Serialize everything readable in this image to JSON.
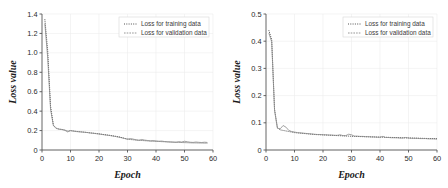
{
  "figure": {
    "panel_count": 2,
    "background": "#ffffff"
  },
  "chart_data": [
    {
      "id": "left-panel",
      "type": "line",
      "title": "",
      "xlabel": "Epoch",
      "ylabel": "Loss value",
      "xlim": [
        0,
        60
      ],
      "ylim": [
        0,
        1.4
      ],
      "xticks": [
        0,
        10,
        20,
        30,
        40,
        50,
        60
      ],
      "xtick_labels": [
        "0",
        "10",
        "20",
        "30",
        "40",
        "50",
        "60"
      ],
      "yticks": [
        0,
        0.2,
        0.4,
        0.6,
        0.8,
        1.0,
        1.2,
        1.4
      ],
      "ytick_labels": [
        "0",
        "0.2",
        "0.4",
        "0.6",
        "0.8",
        "1.0",
        "1.2",
        "1.4"
      ],
      "grid": true,
      "legend_position": "upper-right",
      "legend": [
        "Loss for training data",
        "Loss for validation data"
      ],
      "series": [
        {
          "name": "Loss for training data",
          "style": "dotted",
          "color": "#3c3c3c",
          "x": [
            1,
            2,
            3,
            4,
            5,
            6,
            7,
            8,
            9,
            10,
            11,
            12,
            13,
            14,
            15,
            16,
            17,
            18,
            19,
            20,
            21,
            22,
            23,
            24,
            25,
            26,
            27,
            28,
            29,
            30,
            31,
            32,
            33,
            34,
            35,
            36,
            37,
            38,
            39,
            40,
            41,
            42,
            43,
            44,
            45,
            46,
            47,
            48,
            49,
            50,
            51,
            52,
            53,
            54,
            55,
            56,
            57,
            58
          ],
          "values": [
            1.345,
            1.02,
            0.45,
            0.255,
            0.225,
            0.215,
            0.212,
            0.205,
            0.195,
            0.2,
            0.196,
            0.192,
            0.189,
            0.186,
            0.183,
            0.18,
            0.176,
            0.173,
            0.17,
            0.166,
            0.162,
            0.158,
            0.154,
            0.15,
            0.145,
            0.14,
            0.135,
            0.128,
            0.12,
            0.113,
            0.108,
            0.105,
            0.102,
            0.1,
            0.098,
            0.096,
            0.094,
            0.092,
            0.09,
            0.089,
            0.088,
            0.086,
            0.085,
            0.083,
            0.082,
            0.081,
            0.08,
            0.078,
            0.077,
            0.076,
            0.075,
            0.074,
            0.073,
            0.073,
            0.072,
            0.072,
            0.071,
            0.071
          ]
        },
        {
          "name": "Loss for validation data",
          "style": "solid-thin",
          "color": "#8a8a8a",
          "x": [
            1,
            2,
            3,
            4,
            5,
            6,
            7,
            8,
            9,
            10,
            11,
            12,
            13,
            14,
            15,
            16,
            17,
            18,
            19,
            20,
            21,
            22,
            23,
            24,
            25,
            26,
            27,
            28,
            29,
            30,
            31,
            32,
            33,
            34,
            35,
            36,
            37,
            38,
            39,
            40,
            41,
            42,
            43,
            44,
            45,
            46,
            47,
            48,
            49,
            50,
            51,
            52,
            53,
            54,
            55,
            56,
            57,
            58
          ],
          "values": [
            1.3,
            0.95,
            0.42,
            0.25,
            0.222,
            0.214,
            0.21,
            0.203,
            0.186,
            0.199,
            0.194,
            0.19,
            0.187,
            0.185,
            0.182,
            0.179,
            0.175,
            0.172,
            0.168,
            0.165,
            0.16,
            0.156,
            0.152,
            0.148,
            0.143,
            0.138,
            0.132,
            0.125,
            0.118,
            0.11,
            0.118,
            0.112,
            0.105,
            0.1,
            0.108,
            0.102,
            0.098,
            0.094,
            0.097,
            0.093,
            0.09,
            0.092,
            0.087,
            0.085,
            0.083,
            0.081,
            0.079,
            0.086,
            0.082,
            0.09,
            0.085,
            0.08,
            0.078,
            0.082,
            0.079,
            0.077,
            0.08,
            0.078
          ]
        }
      ]
    },
    {
      "id": "right-panel",
      "type": "line",
      "title": "",
      "xlabel": "Epoch",
      "ylabel": "Loss value",
      "xlim": [
        0,
        60
      ],
      "ylim": [
        0,
        0.5
      ],
      "xticks": [
        0,
        10,
        20,
        30,
        40,
        50,
        60
      ],
      "xtick_labels": [
        "0",
        "10",
        "20",
        "30",
        "40",
        "50",
        "60"
      ],
      "yticks": [
        0,
        0.1,
        0.2,
        0.3,
        0.4,
        0.5
      ],
      "ytick_labels": [
        "0",
        "0.1",
        "0.2",
        "0.3",
        "0.4",
        "0.5"
      ],
      "grid": true,
      "legend_position": "upper-right",
      "legend": [
        "Loss for training data",
        "Loss for validation data"
      ],
      "series": [
        {
          "name": "Loss for training data",
          "style": "dotted",
          "color": "#3c3c3c",
          "x": [
            1,
            2,
            3,
            4,
            5,
            6,
            7,
            8,
            9,
            10,
            11,
            12,
            13,
            14,
            15,
            16,
            17,
            18,
            19,
            20,
            21,
            22,
            23,
            24,
            25,
            26,
            27,
            28,
            29,
            30,
            31,
            32,
            33,
            34,
            35,
            36,
            37,
            38,
            39,
            40,
            41,
            42,
            43,
            44,
            45,
            46,
            47,
            48,
            49,
            50,
            51,
            52,
            53,
            54,
            55,
            56,
            57,
            58,
            59,
            60
          ],
          "values": [
            0.44,
            0.405,
            0.15,
            0.082,
            0.074,
            0.072,
            0.07,
            0.068,
            0.066,
            0.064,
            0.063,
            0.062,
            0.061,
            0.06,
            0.059,
            0.058,
            0.057,
            0.0565,
            0.056,
            0.0555,
            0.055,
            0.0545,
            0.054,
            0.0535,
            0.053,
            0.0525,
            0.052,
            0.0515,
            0.051,
            0.0505,
            0.05,
            0.0497,
            0.0494,
            0.0491,
            0.0488,
            0.0485,
            0.0482,
            0.0479,
            0.0476,
            0.0473,
            0.047,
            0.0467,
            0.0464,
            0.0461,
            0.0458,
            0.0455,
            0.0452,
            0.0449,
            0.0446,
            0.0443,
            0.044,
            0.0437,
            0.0434,
            0.0431,
            0.0428,
            0.0425,
            0.0422,
            0.042,
            0.0418,
            0.0416
          ]
        },
        {
          "name": "Loss for validation data",
          "style": "solid-thin",
          "color": "#8a8a8a",
          "x": [
            1,
            2,
            3,
            4,
            5,
            6,
            7,
            8,
            9,
            10,
            11,
            12,
            13,
            14,
            15,
            16,
            17,
            18,
            19,
            20,
            21,
            22,
            23,
            24,
            25,
            26,
            27,
            28,
            29,
            30,
            31,
            32,
            33,
            34,
            35,
            36,
            37,
            38,
            39,
            40,
            41,
            42,
            43,
            44,
            45,
            46,
            47,
            48,
            49,
            50,
            51,
            52,
            53,
            54,
            55,
            56,
            57,
            58,
            59,
            60
          ],
          "values": [
            0.43,
            0.398,
            0.145,
            0.08,
            0.078,
            0.09,
            0.084,
            0.072,
            0.068,
            0.066,
            0.064,
            0.063,
            0.062,
            0.061,
            0.06,
            0.059,
            0.058,
            0.057,
            0.057,
            0.056,
            0.056,
            0.055,
            0.055,
            0.054,
            0.054,
            0.056,
            0.053,
            0.053,
            0.058,
            0.056,
            0.051,
            0.051,
            0.05,
            0.05,
            0.049,
            0.049,
            0.048,
            0.048,
            0.047,
            0.047,
            0.05,
            0.046,
            0.046,
            0.045,
            0.045,
            0.045,
            0.044,
            0.044,
            0.046,
            0.044,
            0.043,
            0.043,
            0.043,
            0.042,
            0.042,
            0.042,
            0.041,
            0.041,
            0.041,
            0.04
          ]
        }
      ]
    }
  ]
}
